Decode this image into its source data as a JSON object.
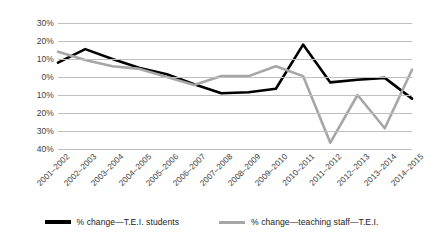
{
  "chart_data": {
    "type": "line",
    "title": "",
    "subtitle": "",
    "xlabel": "",
    "ylabel": "",
    "ylim": [
      -40,
      30
    ],
    "yticks": [
      30,
      20,
      10,
      0,
      -10,
      -20,
      -30,
      -40
    ],
    "ytick_labels": [
      "30%",
      "20%",
      "10%",
      "0%",
      "10%",
      "20%",
      "30%",
      "40%"
    ],
    "grid": true,
    "legend_position": "bottom",
    "categories": [
      "2001–2002",
      "2002–2003",
      "2003–2004",
      "2004–2005",
      "2005–2006",
      "2006–2007",
      "2007–2008",
      "2008–2009",
      "2009–2010",
      "2010–2011",
      "2011–2012",
      "2012–2013",
      "2013–2014",
      "2014–2015"
    ],
    "series": [
      {
        "name": "% change—T.E.I. students",
        "color": "#000000",
        "width": 2.6,
        "values": [
          8,
          15.5,
          10,
          5,
          1.5,
          -4,
          -9,
          -8.5,
          -6.5,
          18,
          -3,
          -1.5,
          -0.5,
          -12
        ]
      },
      {
        "name": "% change—teaching staff—T.E.I.",
        "color": "#a6a6a6",
        "width": 2.6,
        "values": [
          14,
          9.5,
          6,
          4.5,
          0,
          -4.5,
          0.5,
          0.5,
          6,
          0.5,
          -36.5,
          -10,
          -28.5,
          4
        ]
      }
    ]
  },
  "legend": {
    "items": [
      {
        "label": "% change—T.E.I. students",
        "color": "#000000"
      },
      {
        "label": "% change—teaching staff—T.E.I.",
        "color": "#a6a6a6"
      }
    ]
  },
  "colors": {
    "gridline": "#bfbfbf",
    "tick_text": "#3d3d3d",
    "background": "#ffffff"
  }
}
